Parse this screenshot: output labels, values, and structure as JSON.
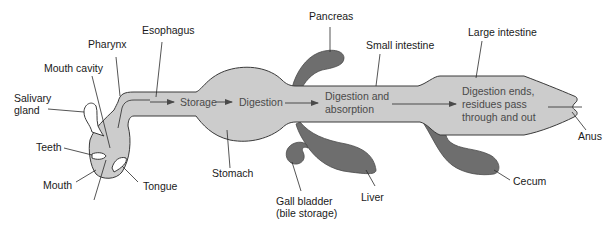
{
  "diagram": {
    "colors": {
      "tract_fill": "#cccccc",
      "organ_fill": "#6e6e6e",
      "outline": "#3a3a3a",
      "label_text": "#1a1a1a",
      "inner_text": "#4a4a4a"
    },
    "labels": {
      "esophagus": "Esophagus",
      "pharynx": "Pharynx",
      "mouth_cavity": "Mouth cavity",
      "salivary_gland_1": "Salivary",
      "salivary_gland_2": "gland",
      "teeth": "Teeth",
      "mouth": "Mouth",
      "tongue": "Tongue",
      "stomach": "Stomach",
      "pancreas": "Pancreas",
      "small_intestine": "Small intestine",
      "large_intestine": "Large intestine",
      "gall_bladder_1": "Gall bladder",
      "gall_bladder_2": "(bile storage)",
      "liver": "Liver",
      "cecum": "Cecum",
      "anus": "Anus"
    },
    "stages": {
      "storage": "Storage",
      "digestion": "Digestion",
      "digestion_absorption_1": "Digestion and",
      "digestion_absorption_2": "absorption",
      "ends_1": "Digestion ends,",
      "ends_2": "residues pass",
      "ends_3": "through and out"
    }
  }
}
